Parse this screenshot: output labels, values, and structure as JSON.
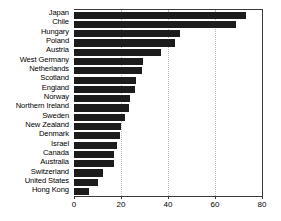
{
  "chart_data": {
    "type": "bar",
    "orientation": "horizontal",
    "title": "",
    "subtitle": "",
    "xlabel": "",
    "ylabel": "",
    "xlim": [
      0,
      80
    ],
    "xticks": [
      0,
      20,
      40,
      60,
      80
    ],
    "grid": "vertical-dotted",
    "legend": "none",
    "bar_color": "#1c1c1c",
    "categories": [
      "Japan",
      "Chile",
      "Hungary",
      "Poland",
      "Austria",
      "West Germany",
      "Netherlands",
      "Scotland",
      "England",
      "Norway",
      "Northern Ireland",
      "Sweden",
      "New Zealand",
      "Denmark",
      "Israel",
      "Canada",
      "Australia",
      "Switzerland",
      "United States",
      "Hong Kong"
    ],
    "values": [
      73,
      69,
      45,
      43,
      37,
      29.5,
      29,
      26.5,
      26,
      24,
      23.5,
      21.5,
      20,
      19.5,
      18.5,
      17,
      17,
      12.5,
      10,
      6.5
    ]
  }
}
